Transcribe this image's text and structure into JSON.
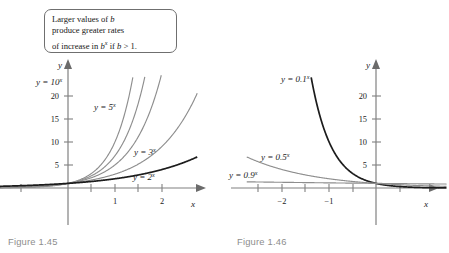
{
  "figures": [
    {
      "id": "figure-1-45",
      "caption": "Figure 1.45",
      "callout": {
        "line1_a": "Larger values of ",
        "line1_b": "b",
        "line2": "produce greater rates",
        "line3_a": "of increase in ",
        "line3_b": "b",
        "line3_sup": "x",
        "line3_c": " if ",
        "line3_d": "b",
        "line3_e": " > 1."
      },
      "axes": {
        "x_label": "x",
        "y_label": "y",
        "x_ticks": [
          "1",
          "2"
        ],
        "y_ticks": [
          "5",
          "10",
          "15",
          "20"
        ],
        "x_range": [
          -1.5,
          2.75
        ],
        "y_range": [
          -6,
          24.5
        ]
      },
      "curve_labels": [
        {
          "prefix": "y = 10",
          "sup": "x"
        },
        {
          "prefix": "y = 5",
          "sup": "x"
        },
        {
          "prefix": "y = 3",
          "sup": "x"
        },
        {
          "prefix": "y = 2",
          "sup": "x"
        }
      ]
    },
    {
      "id": "figure-1-46",
      "caption": "Figure 1.46",
      "callout": {
        "line1_a": "Smaller values of ",
        "line1_b": "b",
        "line1_c": " produce",
        "line2": "greater rates of decrease",
        "line3_a": "in ",
        "line3_b": "b",
        "line3_sup": "x",
        "line3_c": " if 0 < ",
        "line3_d": "b",
        "line3_e": " < 1."
      },
      "axes": {
        "x_label": "x",
        "y_label": "y",
        "x_ticks": [
          "−2",
          "−1"
        ],
        "y_ticks": [
          "5",
          "10",
          "15",
          "20"
        ],
        "x_range": [
          -2.75,
          1.5
        ],
        "y_range": [
          -6,
          24.5
        ]
      },
      "curve_labels": [
        {
          "prefix": "y = 0.1",
          "sup": "x"
        },
        {
          "prefix": "y = 0.5",
          "sup": "x"
        },
        {
          "prefix": "y = 0.9",
          "sup": "x"
        }
      ]
    }
  ],
  "chart_data": [
    {
      "type": "line",
      "title": "Figure 1.45",
      "xlabel": "x",
      "ylabel": "y",
      "xlim": [
        -1.5,
        2.75
      ],
      "ylim": [
        -6,
        24.5
      ],
      "xticks": [
        1,
        2
      ],
      "yticks": [
        5,
        10,
        15,
        20
      ],
      "grid": false,
      "annotation": "Larger values of b produce greater rates of increase in b^x if b > 1.",
      "series": [
        {
          "name": "y = 10^x",
          "base": 10,
          "color": "#8e8e8e",
          "emphasis": false
        },
        {
          "name": "y = 7^x",
          "base": 7,
          "color": "#8e8e8e",
          "emphasis": false
        },
        {
          "name": "y = 5^x",
          "base": 5,
          "color": "#8e8e8e",
          "emphasis": false
        },
        {
          "name": "y = 3^x",
          "base": 3,
          "color": "#8e8e8e",
          "emphasis": false
        },
        {
          "name": "y = 2^x",
          "base": 2,
          "color": "#1c1c1c",
          "emphasis": true
        }
      ]
    },
    {
      "type": "line",
      "title": "Figure 1.46",
      "xlabel": "x",
      "ylabel": "y",
      "xlim": [
        -2.75,
        1.5
      ],
      "ylim": [
        -6,
        24.5
      ],
      "xticks": [
        -2,
        -1
      ],
      "yticks": [
        5,
        10,
        15,
        20
      ],
      "grid": false,
      "annotation": "Smaller values of b produce greater rates of decrease in b^x if 0 < b < 1.",
      "series": [
        {
          "name": "y = 0.1^x",
          "base": 0.1,
          "color": "#1c1c1c",
          "emphasis": true
        },
        {
          "name": "y = 0.5^x",
          "base": 0.5,
          "color": "#8e8e8e",
          "emphasis": false
        },
        {
          "name": "y = 0.9^x",
          "base": 0.9,
          "color": "#9a9a9a",
          "emphasis": false
        }
      ]
    }
  ]
}
